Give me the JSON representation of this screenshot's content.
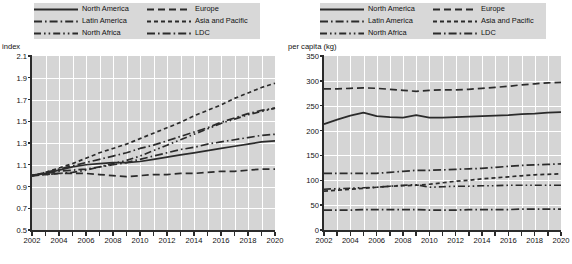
{
  "legend": {
    "entries": [
      {
        "label": "North America",
        "style": "solid"
      },
      {
        "label": "Europe",
        "style": "dash"
      },
      {
        "label": "Latin America",
        "style": "dash-dot"
      },
      {
        "label": "Asia and Pacific",
        "style": "dash-short"
      },
      {
        "label": "North Africa",
        "style": "dash-dot-dot"
      },
      {
        "label": "LDC",
        "style": "dash-dot"
      }
    ]
  },
  "colors": {
    "line": "#2b2b2b",
    "plot_background": "#d5d5d5",
    "grid": "#ffffff",
    "legend_background": "#d8d8d8"
  },
  "chart_data": [
    {
      "type": "line",
      "title": "",
      "ylabel": "index",
      "xlabel": "",
      "ylim": [
        0.5,
        2.1
      ],
      "ytick_step": 0.2,
      "yticks": [
        "0.5",
        "0.7",
        "0.9",
        "1.1",
        "1.3",
        "1.5",
        "1.7",
        "1.9",
        "2.1"
      ],
      "xlim": [
        2002,
        2020
      ],
      "xticks": [
        "2002",
        "2004",
        "2006",
        "2008",
        "2010",
        "2012",
        "2014",
        "2016",
        "2018",
        "2020"
      ],
      "x": [
        2002,
        2003,
        2004,
        2005,
        2006,
        2007,
        2008,
        2009,
        2010,
        2011,
        2012,
        2013,
        2014,
        2015,
        2016,
        2017,
        2018,
        2019,
        2020
      ],
      "grid": true,
      "legend_position": "top",
      "series": [
        {
          "name": "North America",
          "values": [
            1.0,
            1.02,
            1.05,
            1.08,
            1.1,
            1.11,
            1.12,
            1.12,
            1.13,
            1.15,
            1.17,
            1.19,
            1.21,
            1.23,
            1.25,
            1.27,
            1.29,
            1.31,
            1.32
          ]
        },
        {
          "name": "Europe",
          "values": [
            1.0,
            1.01,
            1.02,
            1.02,
            1.02,
            1.01,
            1.0,
            0.99,
            1.0,
            1.01,
            1.01,
            1.02,
            1.02,
            1.03,
            1.04,
            1.04,
            1.05,
            1.06,
            1.06
          ]
        },
        {
          "name": "Latin America",
          "values": [
            1.0,
            1.02,
            1.04,
            1.05,
            1.06,
            1.08,
            1.1,
            1.12,
            1.15,
            1.18,
            1.21,
            1.24,
            1.26,
            1.29,
            1.31,
            1.33,
            1.35,
            1.37,
            1.38
          ]
        },
        {
          "name": "Asia and Pacific",
          "values": [
            1.0,
            1.03,
            1.07,
            1.11,
            1.16,
            1.21,
            1.25,
            1.29,
            1.34,
            1.39,
            1.44,
            1.49,
            1.55,
            1.6,
            1.65,
            1.71,
            1.76,
            1.81,
            1.85
          ]
        },
        {
          "name": "North Africa",
          "values": [
            1.0,
            1.01,
            1.02,
            1.03,
            1.05,
            1.08,
            1.11,
            1.14,
            1.18,
            1.23,
            1.28,
            1.33,
            1.38,
            1.43,
            1.48,
            1.52,
            1.56,
            1.59,
            1.62
          ]
        },
        {
          "name": "LDC",
          "values": [
            1.0,
            1.03,
            1.06,
            1.09,
            1.12,
            1.15,
            1.18,
            1.21,
            1.25,
            1.28,
            1.32,
            1.36,
            1.4,
            1.44,
            1.49,
            1.53,
            1.57,
            1.6,
            1.62
          ]
        }
      ]
    },
    {
      "type": "line",
      "title": "",
      "ylabel": "per capita (kg)",
      "xlabel": "",
      "ylim": [
        0,
        350
      ],
      "ytick_step": 50,
      "yticks": [
        "0",
        "50",
        "100",
        "150",
        "200",
        "250",
        "300",
        "350"
      ],
      "xlim": [
        2002,
        2020
      ],
      "xticks": [
        "2002",
        "2004",
        "2006",
        "2008",
        "2010",
        "2012",
        "2014",
        "2016",
        "2018",
        "2020"
      ],
      "x": [
        2002,
        2003,
        2004,
        2005,
        2006,
        2007,
        2008,
        2009,
        2010,
        2011,
        2012,
        2013,
        2014,
        2015,
        2016,
        2017,
        2018,
        2019,
        2020
      ],
      "grid": true,
      "legend_position": "top",
      "series": [
        {
          "name": "North America",
          "values": [
            213,
            222,
            230,
            236,
            229,
            227,
            226,
            231,
            226,
            226,
            227,
            228,
            229,
            230,
            231,
            233,
            234,
            236,
            237
          ]
        },
        {
          "name": "Europe",
          "values": [
            284,
            284,
            285,
            286,
            285,
            283,
            281,
            279,
            281,
            282,
            282,
            283,
            285,
            287,
            289,
            292,
            294,
            296,
            297
          ]
        },
        {
          "name": "Latin America",
          "values": [
            114,
            114,
            114,
            114,
            114,
            116,
            118,
            120,
            120,
            121,
            122,
            123,
            124,
            126,
            128,
            130,
            131,
            132,
            133
          ]
        },
        {
          "name": "Asia and Pacific",
          "values": [
            78,
            80,
            82,
            84,
            86,
            88,
            89,
            90,
            92,
            95,
            98,
            100,
            103,
            105,
            107,
            109,
            111,
            112,
            113
          ]
        },
        {
          "name": "North Africa",
          "values": [
            82,
            83,
            84,
            85,
            86,
            88,
            90,
            91,
            86,
            87,
            88,
            88,
            89,
            89,
            90,
            90,
            90,
            90,
            90
          ]
        },
        {
          "name": "LDC",
          "values": [
            40,
            40,
            40,
            41,
            41,
            41,
            41,
            41,
            40,
            40,
            40,
            41,
            41,
            41,
            41,
            42,
            42,
            42,
            42
          ]
        }
      ]
    }
  ]
}
